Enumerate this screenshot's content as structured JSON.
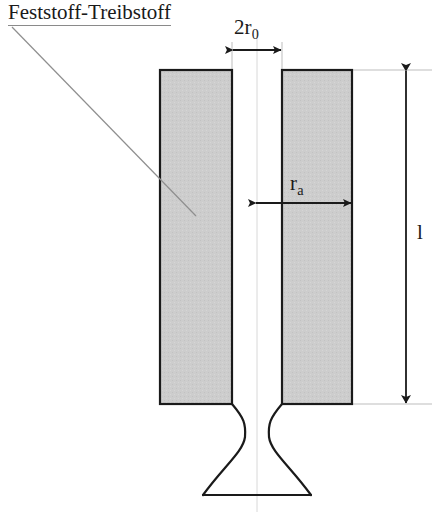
{
  "diagram": {
    "labels": {
      "material": "Feststoff-Treibstoff",
      "bore_diameter_prefix": "2r",
      "bore_diameter_sub": "0",
      "outer_radius_prefix": "r",
      "outer_radius_sub": "a",
      "length": "l"
    },
    "colors": {
      "propellant_fill": "#cccccc",
      "outline": "#1a1a1a",
      "leader_line": "#8f8f8f",
      "extension_line": "#bdbdbd",
      "centerline": "#d8d8d8",
      "background": "#ffffff"
    },
    "geometry": {
      "grain_left_x": 160,
      "grain_right_x": 352,
      "bore_left_x": 232,
      "bore_right_x": 282,
      "centerline_x": 257,
      "grain_top_y": 70,
      "grain_bottom_y": 404,
      "throat_y": 437,
      "nozzle_exit_y": 495,
      "nozzle_exit_left_x": 203,
      "nozzle_exit_right_x": 311,
      "throat_left_x": 245,
      "throat_right_x": 269,
      "dim_bore_arrow_y": 50,
      "dim_radius_arrow_y": 203,
      "dim_length_arrow_x": 406
    }
  }
}
